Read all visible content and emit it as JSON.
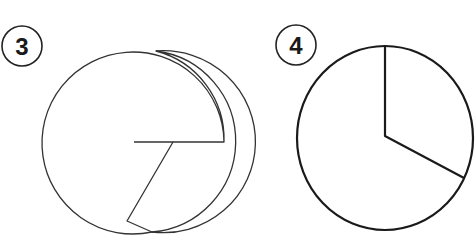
{
  "figures": [
    {
      "label": "3",
      "description": "Two overlapping circles forming a spiral-like sector shape",
      "stroke_color": "#333333"
    },
    {
      "label": "4",
      "description": "Circle divided by two radii into a sector (about one third) and the remainder",
      "stroke_color": "#1a1a1a"
    }
  ]
}
